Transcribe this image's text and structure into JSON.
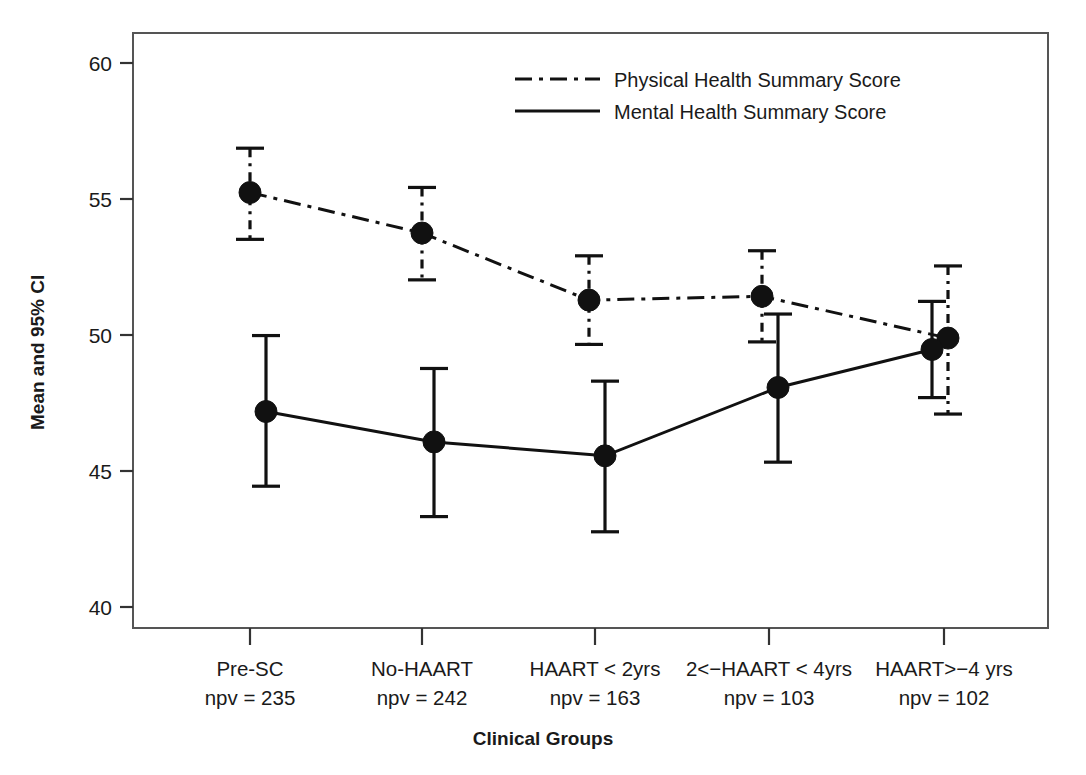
{
  "chart_data": {
    "type": "line",
    "title": "",
    "xlabel": "Clinical Groups",
    "ylabel": "Mean and 95% CI",
    "ylim": [
      38.0,
      61.5
    ],
    "yticks": [
      40,
      45,
      50,
      55,
      60
    ],
    "ytick_labels": [
      "40",
      "45",
      "50",
      "55",
      "40"
    ],
    "grid": false,
    "legend_position": "top-center-right",
    "categories": [
      "Pre-SC",
      "No-HAART",
      "HAART < 2yrs",
      "2<−HAART < 4yrs",
      "HAART>−4 yrs"
    ],
    "category_sublabels": [
      "npv = 235",
      "npv = 242",
      "npv = 163",
      "npv = 103",
      "npv = 102"
    ],
    "series": [
      {
        "name": "Physical Health Summary Score",
        "style": "dash-dot",
        "marker": "filled-circle",
        "values": [
          55.2,
          53.6,
          50.95,
          51.1,
          49.45
        ],
        "ci_lower": [
          53.35,
          51.75,
          49.2,
          49.3,
          46.45
        ],
        "ci_upper": [
          56.95,
          55.4,
          52.7,
          52.9,
          52.3
        ]
      },
      {
        "name": "Mental Health Summary Score",
        "style": "solid",
        "marker": "filled-circle",
        "values": [
          46.55,
          45.35,
          44.8,
          47.5,
          49.0
        ],
        "ci_lower": [
          43.6,
          42.4,
          41.8,
          44.55,
          47.1
        ],
        "ci_upper": [
          49.55,
          48.25,
          47.75,
          50.4,
          50.9
        ]
      }
    ]
  },
  "axis": {
    "y_label": "Mean and 95% CI",
    "x_label": "Clinical Groups",
    "ytick_0": "40",
    "ytick_1": "45",
    "ytick_2": "50",
    "ytick_3": "55",
    "ytick_4": "60"
  },
  "legend": {
    "entries": [
      {
        "label": "Physical Health Summary Score",
        "style": "dash-dot"
      },
      {
        "label": "Mental Health Summary Score",
        "style": "solid"
      }
    ]
  },
  "xlabels": {
    "g0_name": "Pre-SC",
    "g0_npv": "npv = 235",
    "g1_name": "No-HAART",
    "g1_npv": "npv = 242",
    "g2_name": "HAART < 2yrs",
    "g2_npv": "npv = 163",
    "g3_name": "2<−HAART < 4yrs",
    "g3_npv": "npv = 103",
    "g4_name": "HAART>−4 yrs",
    "g4_npv": "npv = 102"
  },
  "colors": {
    "ink": "#111111",
    "frame": "#555555",
    "background": "#ffffff"
  }
}
